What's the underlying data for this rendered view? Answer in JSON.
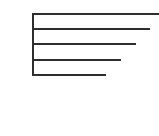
{
  "diagram": {
    "type": "tree-branch-lines",
    "stroke_color": "#2e2e2e",
    "background": "#ffffff",
    "spine": {
      "x": 32,
      "top": 13,
      "bottom": 76,
      "width": 2
    },
    "branches": [
      {
        "y": 13,
        "x_start": 32,
        "x_end": 159
      },
      {
        "y": 28,
        "x_start": 32,
        "x_end": 150
      },
      {
        "y": 43,
        "x_start": 32,
        "x_end": 136
      },
      {
        "y": 59,
        "x_start": 32,
        "x_end": 121
      },
      {
        "y": 74,
        "x_start": 32,
        "x_end": 106
      }
    ]
  }
}
